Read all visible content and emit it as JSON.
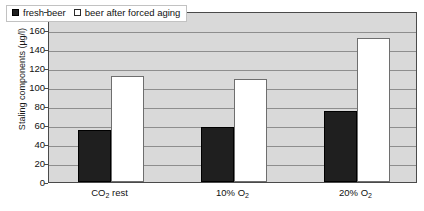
{
  "chart_data": {
    "type": "bar",
    "title": "",
    "xlabel": "",
    "ylabel": "Staling components (µg/l)",
    "categories": [
      "CO2 rest",
      "10% O2",
      "20% O2"
    ],
    "category_labels_rich": [
      {
        "pre": "CO",
        "sub": "2",
        "post": " rest"
      },
      {
        "pre": "10% O",
        "sub": "2",
        "post": ""
      },
      {
        "pre": "20% O",
        "sub": "2",
        "post": ""
      }
    ],
    "series": [
      {
        "name": "fresh beer",
        "values": [
          55,
          58,
          75
        ],
        "color": "#1f1f1f"
      },
      {
        "name": "beer after forced aging",
        "values": [
          112,
          108,
          152
        ],
        "color": "#ffffff"
      }
    ],
    "ylim": [
      0,
      180
    ],
    "ytick_step": 20,
    "yticks": [
      180,
      160,
      140,
      120,
      100,
      80,
      60,
      40,
      20,
      0
    ],
    "grid": true,
    "legend_position": "top-left",
    "plot_background": "#d9d9d9"
  },
  "legend": {
    "entries": [
      {
        "label": "fresh beer",
        "swatch": "filled-black-square"
      },
      {
        "label": "beer after forced aging",
        "swatch": "open-white-square"
      }
    ]
  },
  "colors": {
    "plot_bg": "#d9d9d9",
    "gridline": "#8e8e8e",
    "axis": "#4a4a4a",
    "fresh_beer": "#1f1f1f",
    "aged_beer": "#ffffff",
    "text": "#111111"
  }
}
